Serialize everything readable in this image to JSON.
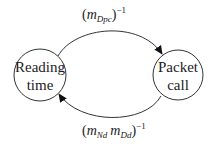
{
  "diagram": {
    "type": "state-transition",
    "nodes": [
      {
        "id": "reading",
        "line1": "Reading",
        "line2": "time"
      },
      {
        "id": "packet",
        "line1": "Packet",
        "line2": "call"
      }
    ],
    "edges": [
      {
        "from": "reading",
        "to": "packet",
        "label": {
          "open": "(",
          "var": "m",
          "sub": "Dpc",
          "close": ")",
          "sup": "−1"
        }
      },
      {
        "from": "packet",
        "to": "reading",
        "label": {
          "open": "(",
          "var1": "m",
          "sub1": "Nd",
          "var2": "m",
          "sub2": "Dd",
          "close": ")",
          "sup": "−1"
        }
      }
    ]
  }
}
